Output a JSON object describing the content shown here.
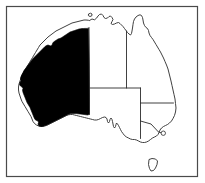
{
  "figure": {
    "width": 205,
    "height": 183,
    "background_color": "#ffffff",
    "frame": {
      "name": "border-frame",
      "stroke_color": "#4a4a4a",
      "stroke_width": 1.2,
      "x": 6.5,
      "y": 6.5,
      "width": 191,
      "height": 170
    }
  },
  "map": {
    "coastline": {
      "name": "australia-mainland-outline",
      "stroke_color": "#2b2b2b",
      "stroke_width": 0.9,
      "fill_color": "#ffffff",
      "path": "M 89.5 20.5 L 92.0 19.0 L 94.5 19.8 L 96.5 18.2 L 98.0 16.0 L 99.5 14.5 L 101.5 14.0 L 103.0 15.5 L 104.0 17.5 L 105.5 18.5 L 107.5 18.0 L 109.0 16.5 L 110.5 16.0 L 112.0 17.5 L 113.0 19.5 L 112.0 21.5 L 111.0 23.5 L 112.5 24.5 L 114.5 24.0 L 116.5 23.0 L 118.5 22.5 L 120.0 23.5 L 121.5 25.0 L 123.0 26.5 L 124.5 28.5 L 126.0 30.5 L 127.5 32.5 L 129.0 34.0 L 130.5 35.0 L 131.5 33.5 L 132.0 31.0 L 132.5 28.0 L 133.0 24.5 L 133.5 21.5 L 134.5 19.0 L 136.0 17.0 L 138.0 15.5 L 140.0 14.8 L 141.5 15.5 L 142.5 17.5 L 143.0 20.0 L 143.5 23.0 L 144.5 25.5 L 146.0 27.5 L 147.5 28.5 L 148.5 30.5 L 149.0 33.0 L 150.0 35.5 L 151.5 37.5 L 153.0 39.5 L 154.5 42.0 L 156.0 44.5 L 157.5 47.0 L 159.0 49.5 L 160.5 52.0 L 162.0 55.0 L 163.5 58.0 L 165.0 61.5 L 166.5 65.0 L 168.0 69.0 L 169.0 73.0 L 170.0 77.0 L 171.0 81.0 L 172.0 85.5 L 173.0 90.0 L 174.0 94.5 L 175.0 99.0 L 175.5 103.5 L 176.0 108.0 L 175.5 112.0 L 174.5 115.5 L 173.0 118.5 L 171.5 121.0 L 169.5 123.0 L 167.5 124.5 L 165.5 125.5 L 163.5 126.5 L 161.5 128.0 L 160.0 130.0 L 159.0 132.5 L 158.0 134.5 L 156.5 136.0 L 154.5 137.0 L 152.5 138.0 L 150.5 139.5 L 148.5 141.0 L 146.5 142.0 L 144.5 142.5 L 142.5 142.5 L 140.5 142.0 L 138.5 141.0 L 136.5 140.0 L 134.5 139.5 L 132.5 139.5 L 130.5 139.0 L 128.5 138.0 L 126.5 137.0 L 124.5 135.5 L 123.0 133.5 L 121.5 131.5 L 120.5 129.5 L 119.5 127.5 L 118.5 125.5 L 117.5 124.0 L 116.5 123.0 L 116.0 124.5 L 115.5 126.5 L 114.5 128.0 L 113.5 126.5 L 113.0 124.0 L 112.5 121.5 L 112.0 119.5 L 111.0 118.0 L 110.0 119.5 L 109.5 121.5 L 108.5 123.0 L 107.5 121.5 L 107.0 119.0 L 106.0 117.5 L 104.5 117.0 L 102.5 117.5 L 100.5 118.5 L 98.5 119.5 L 96.5 120.0 L 94.5 120.0 L 92.5 119.5 L 90.5 119.0 L 88.5 118.5 L 86.5 118.0 L 84.5 117.5 L 82.5 117.0 L 80.5 116.5 L 78.5 116.0 L 76.5 115.5 L 74.5 115.0 L 72.5 114.5 L 70.5 114.5 L 68.5 114.8 L 66.5 115.5 L 64.5 116.5 L 62.5 117.5 L 60.5 118.5 L 58.5 119.5 L 56.5 120.5 L 54.5 121.5 L 52.5 122.5 L 50.5 123.5 L 48.5 124.5 L 46.5 125.5 L 44.5 126.0 L 42.5 126.5 L 40.5 126.5 L 38.5 126.0 L 36.5 125.0 L 34.5 123.5 L 33.0 121.5 L 32.0 119.0 L 31.0 116.5 L 29.5 114.0 L 28.0 111.5 L 26.5 109.0 L 25.0 106.5 L 23.5 104.0 L 22.0 101.5 L 21.0 99.0 L 20.0 96.0 L 19.0 93.0 L 18.5 90.0 L 18.5 87.0 L 19.0 84.0 L 20.0 81.0 L 21.0 78.0 L 22.0 75.0 L 23.5 72.5 L 25.0 70.0 L 26.5 67.5 L 28.0 65.0 L 29.5 62.5 L 31.0 60.0 L 32.5 57.5 L 34.0 55.0 L 35.5 52.5 L 37.0 50.0 L 38.5 47.5 L 40.0 45.0 L 42.0 43.0 L 44.0 41.0 L 46.0 39.0 L 48.0 37.0 L 50.0 35.5 L 52.0 34.0 L 54.0 32.5 L 56.0 31.0 L 58.0 30.0 L 60.0 29.0 L 62.0 28.0 L 64.0 27.0 L 66.0 26.0 L 68.0 25.0 L 70.0 24.0 L 72.0 23.0 L 74.0 22.5 L 76.0 22.0 L 78.0 21.5 L 80.0 21.0 L 82.0 20.5 L 84.0 20.0 L 86.0 20.0 L 88.0 20.2 Z"
    },
    "highlighted_region": {
      "name": "western-australia-filled",
      "label": "Western Australia",
      "fill_color": "#000000",
      "stroke_color": "#000000",
      "path": "M 88.5 28.5 L 88.8 40.0 L 89.0 52.0 L 89.2 64.0 L 89.3 76.0 L 89.4 88.0 L 89.5 96.0 L 89.5 114.0 L 88.0 115.0 L 86.0 114.8 L 84.0 114.5 L 82.0 114.2 L 80.0 114.0 L 78.0 113.8 L 76.0 113.6 L 74.0 113.5 L 72.0 113.5 L 70.0 113.8 L 68.0 114.5 L 66.0 115.5 L 64.0 116.5 L 62.0 117.5 L 60.0 118.5 L 58.0 119.5 L 56.0 120.5 L 54.0 121.5 L 52.0 122.5 L 50.0 123.5 L 48.0 124.5 L 46.0 125.3 L 44.0 126.0 L 42.0 126.5 L 40.0 126.3 L 38.5 125.5 L 38.0 124.0 L 38.5 122.5 L 38.0 121.0 L 36.5 120.5 L 35.0 119.5 L 34.0 117.5 L 33.0 115.0 L 32.0 112.5 L 31.0 110.0 L 30.0 107.5 L 28.5 105.0 L 27.0 102.5 L 26.0 100.0 L 25.0 97.5 L 24.0 95.0 L 23.0 92.5 L 22.5 90.0 L 23.0 88.5 L 22.0 87.0 L 20.5 86.0 L 19.5 84.5 L 20.0 82.5 L 21.0 80.5 L 20.5 78.5 L 21.0 76.5 L 22.0 74.5 L 23.0 72.5 L 24.0 70.5 L 25.5 68.5 L 27.0 66.5 L 28.5 64.5 L 30.0 62.5 L 31.5 60.5 L 33.0 58.5 L 34.5 57.0 L 36.0 55.5 L 37.5 54.0 L 39.0 52.5 L 40.5 51.0 L 42.0 49.5 L 43.5 48.0 L 45.0 46.5 L 46.5 45.5 L 48.0 45.0 L 49.5 45.5 L 51.0 46.0 L 52.0 45.0 L 52.5 43.5 L 53.5 42.0 L 55.0 41.0 L 56.5 40.0 L 58.0 39.0 L 59.5 38.5 L 61.0 38.0 L 62.5 37.0 L 64.0 36.0 L 65.5 35.0 L 67.0 34.0 L 68.5 33.0 L 70.0 32.0 L 71.5 31.5 L 73.0 31.0 L 74.5 30.5 L 76.0 30.0 L 77.5 29.5 L 79.0 29.0 L 80.5 28.8 L 82.0 28.6 L 83.5 28.5 L 85.0 28.4 L 86.5 28.4 Z"
    },
    "internal_borders": [
      {
        "name": "border-wa-east",
        "description": "Western Australia eastern border",
        "path": "M 89.0 27.5 L 89.5 114.5"
      },
      {
        "name": "border-nt-sa",
        "description": "Northern Territory / South Australia border",
        "path": "M 89.3 88.0 L 140.5 88.0"
      },
      {
        "name": "border-nt-qld",
        "description": "Northern Territory / Queensland border",
        "path": "M 126.5 31.0 L 126.5 88.0"
      },
      {
        "name": "border-sa-east",
        "description": "South Australia eastern border",
        "path": "M 140.5 88.0 L 140.5 138.5"
      },
      {
        "name": "border-qld-nsw",
        "description": "Queensland / New South Wales border",
        "path": "M 140.5 103.0 L 173.5 103.0"
      },
      {
        "name": "border-nsw-vic",
        "description": "New South Wales / Victoria border",
        "path": "M 140.5 121.0 L 151.0 124.0 L 158.5 132.0 L 163.5 133.5"
      }
    ],
    "islands": [
      {
        "name": "tasmania-island",
        "label": "Tasmania",
        "stroke_color": "#2b2b2b",
        "fill_color": "#ffffff",
        "path": "M 149.0 159.5 L 152.0 158.5 L 155.5 159.0 L 157.5 161.0 L 157.0 164.5 L 155.5 168.0 L 153.5 170.5 L 151.0 171.0 L 149.5 168.5 L 148.5 164.5 Z"
      },
      {
        "name": "melville-island",
        "label": "Melville Island",
        "stroke_color": "#2b2b2b",
        "fill_color": "#ffffff",
        "path": "M 88.5 14.0 L 90.5 13.2 L 92.0 14.0 L 91.8 15.8 L 90.0 16.5 L 88.4 15.6 Z"
      }
    ],
    "markers": [
      {
        "name": "city-marker-circle",
        "shape": "circle",
        "cx": 163.3,
        "cy": 133.2,
        "r": 2.2,
        "stroke_color": "#2b2b2b",
        "fill_color": "#ffffff"
      }
    ]
  }
}
